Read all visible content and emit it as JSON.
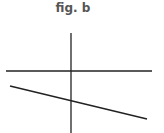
{
  "figure": {
    "title": "fig. b",
    "colors": {
      "line": "#222222",
      "title": "#555555",
      "background": "#ffffff"
    },
    "axes": {
      "vertical": {
        "x1": 71,
        "y1": 33,
        "x2": 71,
        "y2": 133
      },
      "horizontal": {
        "x1": 6,
        "y1": 71,
        "x2": 152,
        "y2": 71
      }
    },
    "lines": [
      {
        "label": "sloped-line",
        "x1": 10,
        "y1": 86,
        "x2": 147,
        "y2": 119
      }
    ]
  }
}
